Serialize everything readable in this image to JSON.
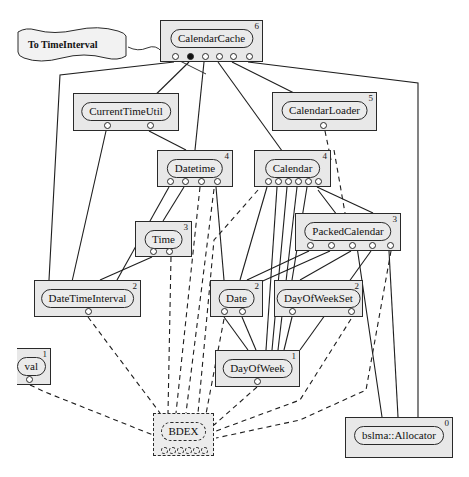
{
  "diagram": {
    "kind": "component-dependency-diagram",
    "width": 469,
    "height": 477,
    "colors": {
      "node_fill": "#e8e8e8",
      "pill_fill": "#ebebeb",
      "stroke": "#2a2a2a",
      "text": "#111111",
      "page_background": "#ffffff",
      "port_fill": "#ffffff",
      "port_filled": "#111111"
    },
    "annotation": {
      "label": "To TimeInterval",
      "shape": "wavy-banner"
    },
    "nodes": [
      {
        "id": "calendar-cache",
        "label": "CalendarCache",
        "level": "6",
        "x": 160,
        "y": 20,
        "w": 103,
        "h": 42,
        "style": "solid",
        "ports": [
          {
            "x": 14,
            "filled": false
          },
          {
            "x": 29,
            "filled": true
          },
          {
            "x": 44,
            "filled": false
          },
          {
            "x": 58,
            "filled": false
          },
          {
            "x": 72,
            "filled": false
          },
          {
            "x": 88,
            "filled": false
          }
        ]
      },
      {
        "id": "current-time-util",
        "label": "CurrentTimeUtil",
        "level": "",
        "x": 73,
        "y": 93,
        "w": 106,
        "h": 38,
        "style": "solid",
        "ports": [
          {
            "x": 33,
            "filled": false
          },
          {
            "x": 76,
            "filled": false
          }
        ]
      },
      {
        "id": "calendar-loader",
        "label": "CalendarLoader",
        "level": "5",
        "x": 272,
        "y": 92,
        "w": 105,
        "h": 39,
        "style": "solid",
        "ports": [
          {
            "x": 50,
            "filled": false
          }
        ]
      },
      {
        "id": "datetime",
        "label": "Datetime",
        "level": "4",
        "x": 157,
        "y": 150,
        "w": 76,
        "h": 37,
        "style": "solid",
        "ports": [
          {
            "x": 12,
            "filled": false
          },
          {
            "x": 27,
            "filled": false
          },
          {
            "x": 43,
            "filled": false
          },
          {
            "x": 59,
            "filled": false
          }
        ]
      },
      {
        "id": "calendar",
        "label": "Calendar",
        "level": "4",
        "x": 254,
        "y": 150,
        "w": 77,
        "h": 37,
        "style": "solid",
        "ports": [
          {
            "x": 13,
            "filled": false
          },
          {
            "x": 23,
            "filled": false
          },
          {
            "x": 33,
            "filled": false
          },
          {
            "x": 43,
            "filled": false
          },
          {
            "x": 53,
            "filled": false
          },
          {
            "x": 63,
            "filled": false
          }
        ]
      },
      {
        "id": "time",
        "label": "Time",
        "level": "3",
        "x": 135,
        "y": 221,
        "w": 57,
        "h": 36,
        "style": "solid",
        "ports": [
          {
            "x": 17,
            "filled": false
          },
          {
            "x": 33,
            "filled": false
          }
        ]
      },
      {
        "id": "packed-calendar",
        "label": "PackedCalendar",
        "level": "3",
        "x": 295,
        "y": 213,
        "w": 106,
        "h": 38,
        "style": "solid",
        "ports": [
          {
            "x": 14,
            "filled": false
          },
          {
            "x": 35,
            "filled": false
          },
          {
            "x": 56,
            "filled": false
          },
          {
            "x": 76,
            "filled": false
          },
          {
            "x": 94,
            "filled": false
          }
        ]
      },
      {
        "id": "date-time-interval",
        "label": "DateTimeInterval",
        "level": "2",
        "x": 34,
        "y": 280,
        "w": 107,
        "h": 37,
        "style": "solid",
        "ports": [
          {
            "x": 53,
            "filled": false
          }
        ]
      },
      {
        "id": "date",
        "label": "Date",
        "level": "2",
        "x": 210,
        "y": 280,
        "w": 53,
        "h": 37,
        "style": "solid",
        "ports": [
          {
            "x": 13,
            "filled": false
          },
          {
            "x": 31,
            "filled": false
          }
        ]
      },
      {
        "id": "day-of-week-set",
        "label": "DayOfWeekSet",
        "level": "2",
        "x": 274,
        "y": 280,
        "w": 89,
        "h": 37,
        "style": "solid",
        "ports": [
          {
            "x": 17,
            "filled": false
          },
          {
            "x": 76,
            "filled": false
          }
        ]
      },
      {
        "id": "day-of-week",
        "label": "DayOfWeek",
        "level": "1",
        "x": 215,
        "y": 350,
        "w": 85,
        "h": 37,
        "style": "solid",
        "ports": [
          {
            "x": 41,
            "filled": false
          }
        ]
      },
      {
        "id": "interval-clipped",
        "label": "val",
        "level": "1",
        "x": 17,
        "y": 348,
        "w": 34,
        "h": 37,
        "style": "solid-clipped",
        "ports": [
          {
            "x": 12,
            "filled": false
          }
        ]
      },
      {
        "id": "bdex",
        "label": "BDEX",
        "level": "",
        "x": 153,
        "y": 413,
        "w": 61,
        "h": 43,
        "style": "dashed",
        "ports": [
          {
            "x": 10,
            "filled": false
          },
          {
            "x": 18,
            "filled": false
          },
          {
            "x": 26,
            "filled": false
          },
          {
            "x": 34,
            "filled": false
          },
          {
            "x": 42,
            "filled": false
          },
          {
            "x": 50,
            "filled": false
          }
        ]
      },
      {
        "id": "bslma-allocator",
        "label": "bslma::Allocator",
        "level": "0",
        "x": 345,
        "y": 417,
        "w": 108,
        "h": 41,
        "style": "solid",
        "ports": []
      }
    ],
    "edges_solid_note": "solid lines = compile-time dependencies",
    "edges_dashed_note": "dashed lines = BDEX / allocator protocol dependencies"
  }
}
